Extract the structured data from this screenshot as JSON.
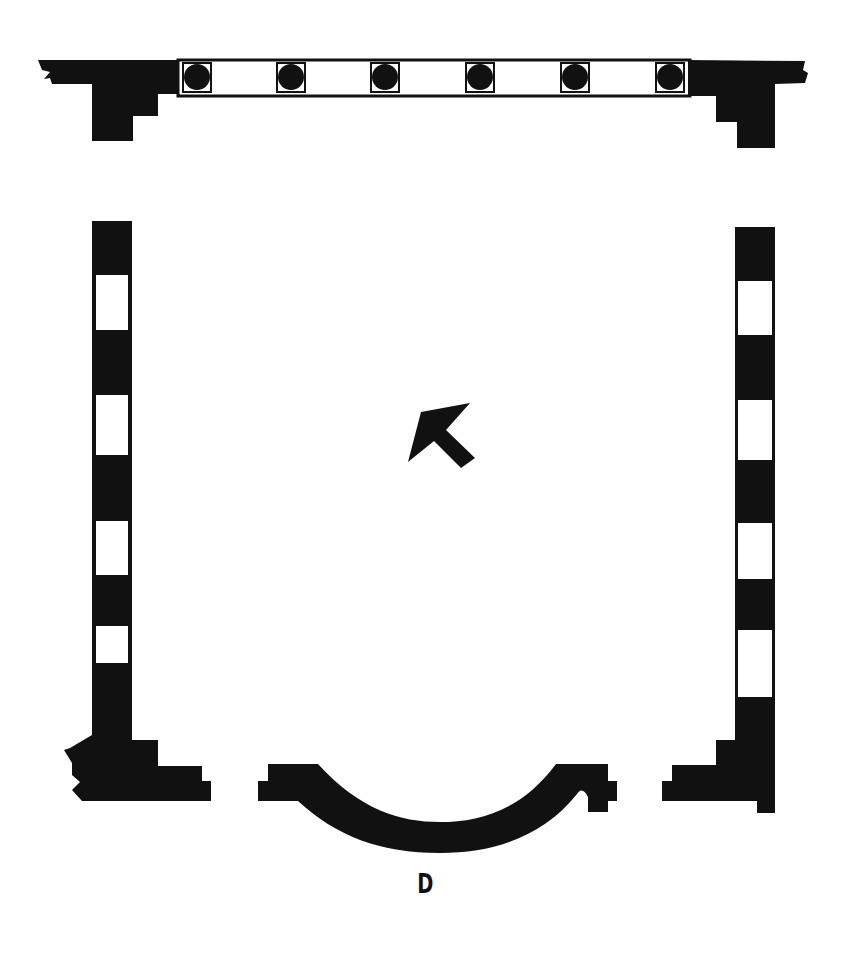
{
  "diagram": {
    "type": "architectural-floor-plan",
    "label": "D",
    "colors": {
      "wall": "#111111",
      "background": "#ffffff"
    },
    "elements": {
      "top_colonnade": {
        "description": "Front portico with six columns between two corner piers",
        "column_count": 6
      },
      "left_wall": {
        "description": "Side wall with alternating solid piers and openings",
        "opening_count": 4
      },
      "right_wall": {
        "description": "Side wall with alternating solid piers and openings",
        "opening_count": 4
      },
      "rear_apse": {
        "description": "Curved apse wall at the rear between two stepped corner blocks"
      },
      "north_arrow": {
        "description": "Orientation arrow pointing up-left",
        "direction": "north-west"
      }
    }
  }
}
